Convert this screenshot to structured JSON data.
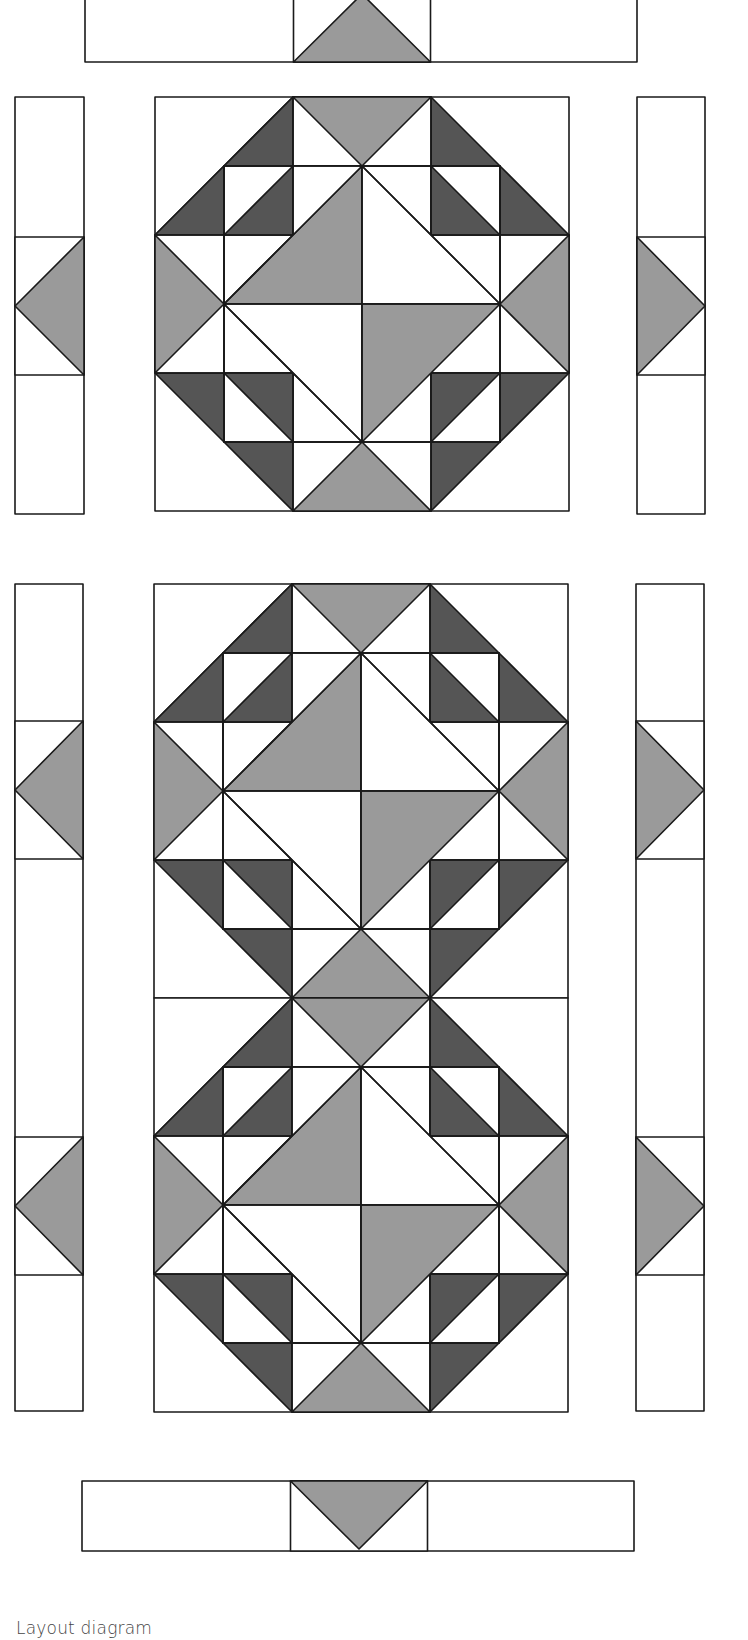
{
  "caption": "Layout diagram",
  "colors": {
    "background": "#ffffff",
    "outline": "#1a1a1a",
    "light_gray": "#9a9a9a",
    "dark_gray": "#555555",
    "white": "#ffffff"
  },
  "layout": {
    "unit": 69,
    "top_border": {
      "x": 85,
      "y": -10,
      "w": 552,
      "h": 72,
      "center_triangle": "up"
    },
    "bottom_border": {
      "x": 82,
      "y": 1481,
      "w": 552,
      "h": 70,
      "center_triangle": "down"
    },
    "blocks": [
      {
        "name": "block-1",
        "x": 155,
        "y": 97,
        "size": 414
      },
      {
        "name": "block-2a",
        "x": 154,
        "y": 584,
        "size": 414
      },
      {
        "name": "block-2b",
        "x": 154,
        "y": 998,
        "size": 414
      }
    ],
    "side_strips": [
      {
        "name": "left-strip-1",
        "x": 15,
        "y": 97,
        "w": 69,
        "h": 417,
        "triangles": [
          {
            "cy": 306,
            "dir": "left"
          }
        ]
      },
      {
        "name": "right-strip-1",
        "x": 637,
        "y": 97,
        "w": 68,
        "h": 417,
        "triangles": [
          {
            "cy": 306,
            "dir": "right"
          }
        ]
      },
      {
        "name": "left-strip-2",
        "x": 15,
        "y": 584,
        "w": 68,
        "h": 827,
        "triangles": [
          {
            "cy": 790,
            "dir": "left"
          },
          {
            "cy": 1206,
            "dir": "left"
          }
        ]
      },
      {
        "name": "right-strip-2",
        "x": 636,
        "y": 584,
        "w": 68,
        "h": 827,
        "triangles": [
          {
            "cy": 790,
            "dir": "right"
          },
          {
            "cy": 1206,
            "dir": "right"
          }
        ]
      }
    ]
  }
}
